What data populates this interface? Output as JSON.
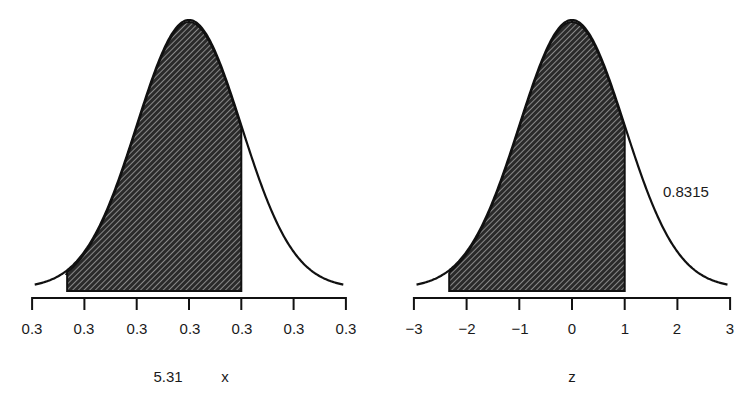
{
  "chart_data": [
    {
      "type": "area",
      "subtype": "normal-distribution-shaded",
      "title": "",
      "xlabel": "x",
      "xlabel_extra": "5.31",
      "ylabel": "",
      "x_ticks": [
        "0.3",
        "0.3",
        "0.3",
        "0.3",
        "0.3",
        "0.3",
        "0.3"
      ],
      "x_tick_positions_z": [
        -3,
        -2,
        -1,
        0,
        1,
        2,
        3
      ],
      "shaded_region_z": [
        -2.33,
        1.0
      ],
      "grid": false,
      "legend": null
    },
    {
      "type": "area",
      "subtype": "standard-normal-shaded",
      "title": "",
      "xlabel": "z",
      "ylabel": "",
      "x_ticks": [
        "−3",
        "−2",
        "−1",
        "0",
        "1",
        "2",
        "3"
      ],
      "x_tick_positions_z": [
        -3,
        -2,
        -1,
        0,
        1,
        2,
        3
      ],
      "xlim": [
        -3,
        3
      ],
      "shaded_region_z": [
        -2.33,
        1.0
      ],
      "shaded_area": 0.8315,
      "annotation": "0.8315",
      "grid": false,
      "legend": null
    }
  ],
  "left": {
    "ticks": [
      "0.3",
      "0.3",
      "0.3",
      "0.3",
      "0.3",
      "0.3",
      "0.3"
    ],
    "axis_value": "5.31",
    "axis_title": "x"
  },
  "right": {
    "ticks": [
      "−3",
      "−2",
      "−1",
      "0",
      "1",
      "2",
      "3"
    ],
    "axis_title": "z",
    "annotation": "0.8315"
  }
}
